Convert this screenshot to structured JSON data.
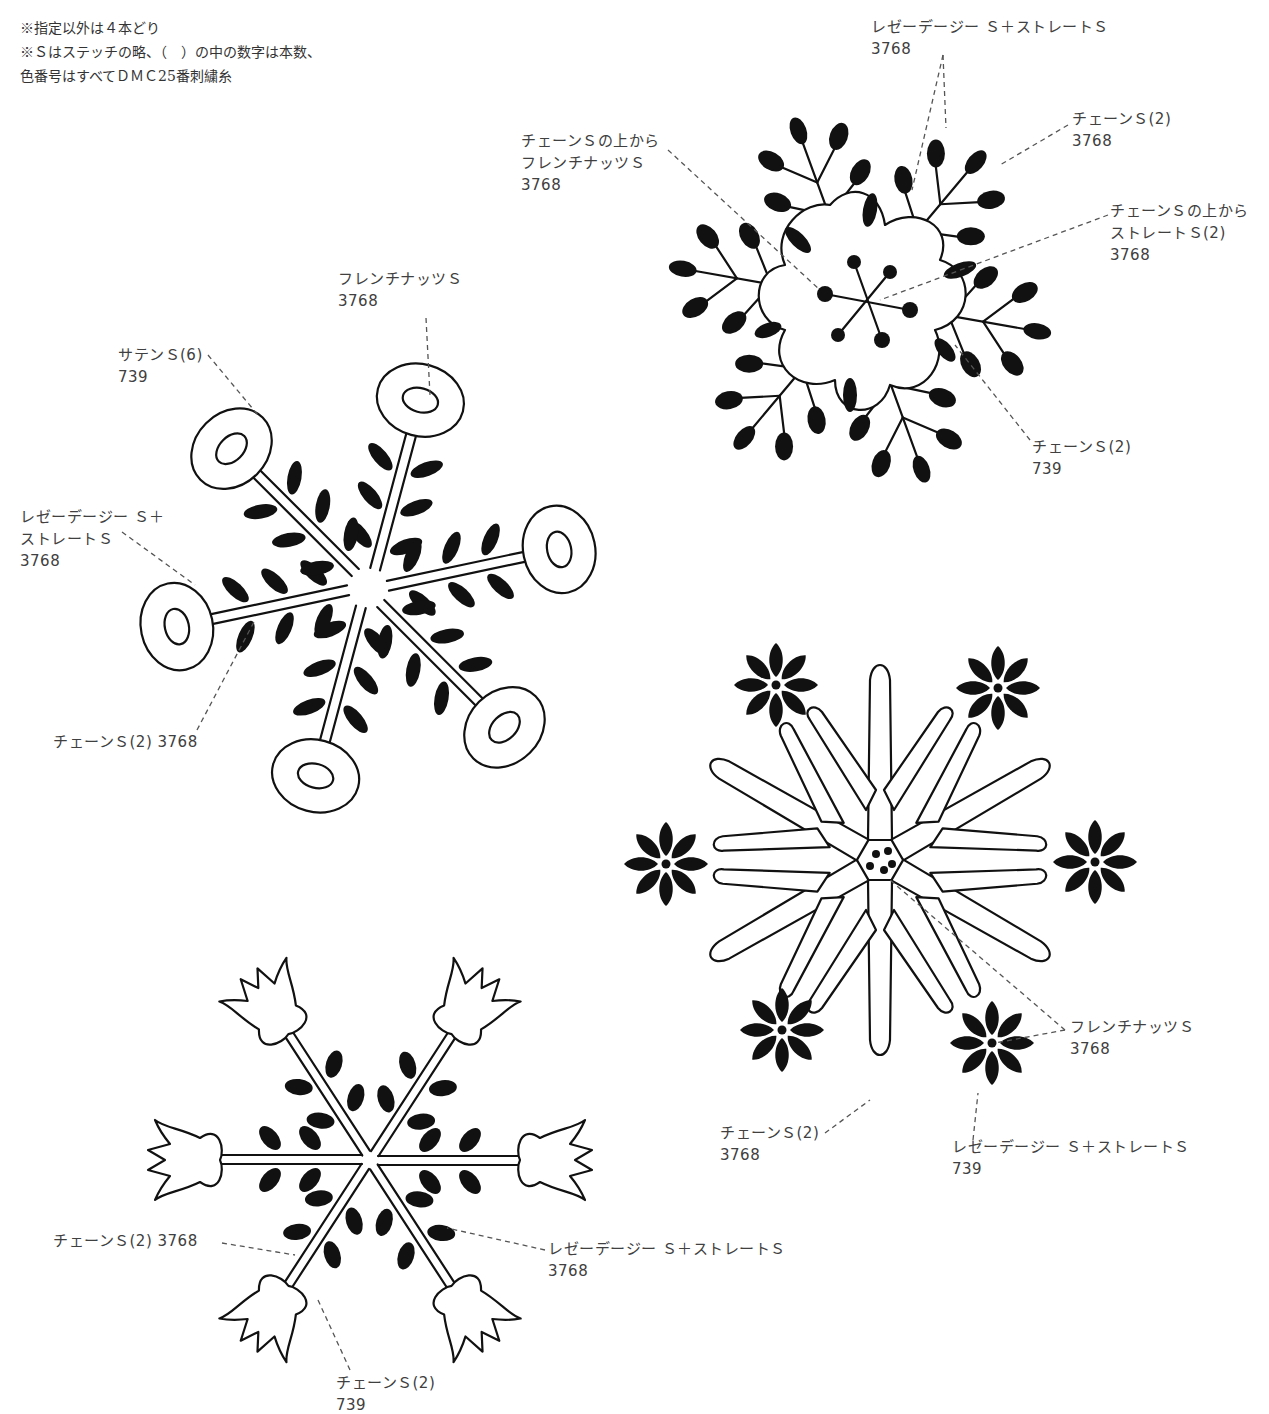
{
  "notes": [
    "※指定以外は４本どり",
    "※Ｓはステッチの略、（　）の中の数字は本数、",
    "色番号はすべてＤＭＣ25番刺繍糸"
  ],
  "motifs": {
    "top_right": {
      "labels": [
        {
          "lines": [
            "レゼーデージー Ｓ＋ストレートＳ",
            "3768"
          ]
        },
        {
          "lines": [
            "チェーンＳ(2)",
            "3768"
          ]
        },
        {
          "lines": [
            "チェーンＳの上から",
            "フレンチナッツＳ",
            "3768"
          ]
        },
        {
          "lines": [
            "チェーンＳの上から",
            "ストレートＳ(2)",
            "3768"
          ]
        },
        {
          "lines": [
            "チェーンＳ(2)",
            "739"
          ]
        }
      ]
    },
    "left": {
      "labels": [
        {
          "lines": [
            "フレンチナッツＳ",
            "3768"
          ]
        },
        {
          "lines": [
            "サテンＳ(6)",
            "739"
          ]
        },
        {
          "lines": [
            "レゼーデージー Ｓ＋",
            "ストレートＳ",
            "3768"
          ]
        },
        {
          "lines": [
            "チェーンＳ(2)  3768"
          ]
        }
      ]
    },
    "bottom_right": {
      "labels": [
        {
          "lines": [
            "フレンチナッツＳ",
            "3768"
          ]
        },
        {
          "lines": [
            "チェーンＳ(2)",
            "3768"
          ]
        },
        {
          "lines": [
            "レゼーデージー Ｓ＋ストレートＳ",
            "739"
          ]
        }
      ]
    },
    "bottom_left": {
      "labels": [
        {
          "lines": [
            "チェーンＳ(2)  3768"
          ]
        },
        {
          "lines": [
            "レゼーデージー Ｓ＋ストレートＳ",
            "3768"
          ]
        },
        {
          "lines": [
            "チェーンＳ(2)",
            "739"
          ]
        }
      ]
    }
  }
}
